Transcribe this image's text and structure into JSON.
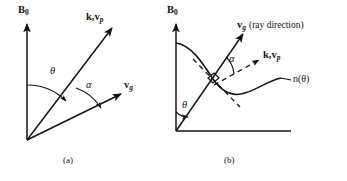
{
  "figure": {
    "panels": [
      {
        "id": "a",
        "caption": "(a)",
        "axis_label": "B",
        "axis_label_sub": "0",
        "vectors": [
          {
            "name": "k,v",
            "sub": "p",
            "label": "k,v_p"
          },
          {
            "name": "v",
            "sub": "g",
            "label": "v_g"
          }
        ],
        "angles": [
          {
            "symbol": "θ",
            "name": "theta"
          },
          {
            "symbol": "α",
            "name": "alpha"
          }
        ]
      },
      {
        "id": "b",
        "caption": "(b)",
        "axis_label": "B",
        "axis_label_sub": "0",
        "vectors": [
          {
            "name": "v",
            "sub": "g",
            "label": "v_g",
            "note": "(ray direction)"
          },
          {
            "name": "k,v",
            "sub": "p",
            "label": "k,v_p"
          }
        ],
        "curve_label": "n(θ)",
        "angles": [
          {
            "symbol": "θ",
            "name": "theta"
          },
          {
            "symbol": "α",
            "name": "alpha"
          }
        ]
      }
    ],
    "colors": {
      "ink": "#141414",
      "background": "#ffffff"
    }
  },
  "panel_a": {
    "axis_b0_letter": "B",
    "axis_b0_sub": "0",
    "vec_k_vp_main": "k,v",
    "vec_k_vp_sub": "p",
    "vec_vg_main": "v",
    "vec_vg_sub": "g",
    "angle_theta": "θ",
    "angle_alpha": "α",
    "caption": "(a)"
  },
  "panel_b": {
    "axis_b0_letter": "B",
    "axis_b0_sub": "0",
    "vec_vg_main": "v",
    "vec_vg_sub": "g",
    "vec_vg_note": "(ray direction)",
    "vec_k_vp_main": "k,v",
    "vec_k_vp_sub": "p",
    "curve_label": "n(θ)",
    "angle_theta": "θ",
    "angle_alpha": "α",
    "caption": "(b)"
  }
}
